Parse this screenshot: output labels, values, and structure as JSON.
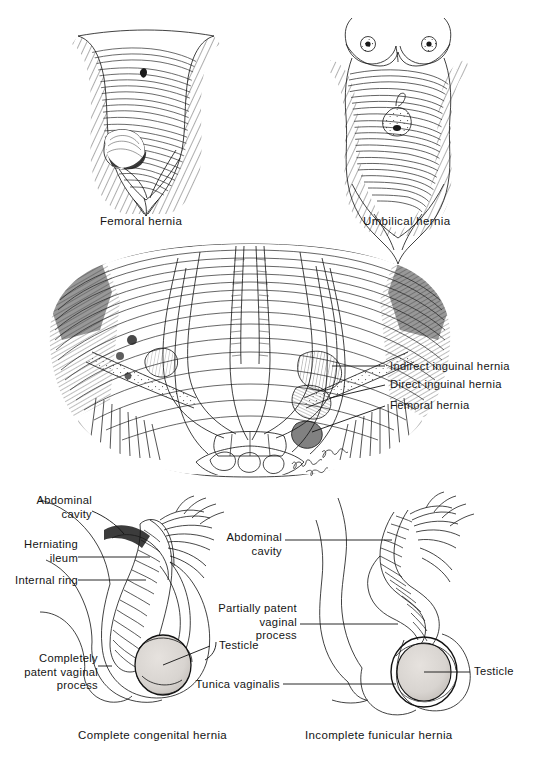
{
  "plate": {
    "title": "Hernia types anatomical plate",
    "background": "#ffffff",
    "ink_color": "#111111",
    "tissue_fill": "#d8d4d0",
    "signature": "Cooper after Spalteholz"
  },
  "figures": [
    {
      "id": "femoral-hernia-external",
      "caption": "Femoral hernia",
      "description": "External view of male lower abdomen and groin with a rounded bulge in the right femoral region",
      "labels": []
    },
    {
      "id": "umbilical-hernia-external",
      "caption": "Umbilical hernia",
      "description": "External view of female torso with protruding umbilicus",
      "labels": []
    },
    {
      "id": "inguinal-region-internal",
      "caption": "",
      "description": "Internal posterior view of the lower abdominal wall and inguinal region",
      "labels": [
        {
          "text": "Indirect inguinal hernia",
          "side": "right"
        },
        {
          "text": "Direct inguinal hernia",
          "side": "right"
        },
        {
          "text": "Femoral hernia",
          "side": "right"
        }
      ]
    },
    {
      "id": "complete-congenital-hernia",
      "caption": "Complete congenital hernia",
      "description": "Sagittal section of scrotum with herniated ileum reaching the testicle",
      "labels": [
        {
          "text": "Abdominal cavity",
          "lines": [
            "Abdominal",
            "cavity"
          ],
          "side": "left"
        },
        {
          "text": "Herniating ileum",
          "lines": [
            "Herniating",
            "ileum"
          ],
          "side": "left"
        },
        {
          "text": "Internal ring",
          "lines": [
            "Internal ring"
          ],
          "side": "left"
        },
        {
          "text": "Completely patent vaginal process",
          "lines": [
            "Completely",
            "patent vaginal",
            "process"
          ],
          "side": "left"
        },
        {
          "text": "Testicle",
          "lines": [
            "Testicle"
          ],
          "side": "right"
        }
      ]
    },
    {
      "id": "incomplete-funicular-hernia",
      "caption": "Incomplete funicular hernia",
      "description": "Sagittal section of scrotum with hernia stopping above the tunica vaginalis",
      "labels": [
        {
          "text": "Abdominal cavity",
          "lines": [
            "Abdominal",
            "cavity"
          ],
          "side": "left"
        },
        {
          "text": "Partially patent vaginal process",
          "lines": [
            "Partially  patent",
            "vaginal",
            "process"
          ],
          "side": "left"
        },
        {
          "text": "Tunica vaginalis",
          "lines": [
            "Tunica  vaginalis"
          ],
          "side": "left"
        },
        {
          "text": "Testicle",
          "lines": [
            "Testicle"
          ],
          "side": "right"
        }
      ]
    }
  ],
  "captions": {
    "femoral": "Femoral hernia",
    "umbilical": "Umbilical hernia",
    "complete_congenital": "Complete congenital hernia",
    "incomplete_funicular": "Incomplete funicular hernia"
  },
  "mid_labels": {
    "indirect": "Indirect inguinal hernia",
    "direct": "Direct inguinal hernia",
    "femoral": "Femoral hernia"
  },
  "left_fig_labels": {
    "abdominal_1": "Abdominal",
    "abdominal_2": "cavity",
    "herniating_1": "Herniating",
    "herniating_2": "ileum",
    "internal_ring": "Internal ring",
    "patent_1": "Completely",
    "patent_2": "patent vaginal",
    "patent_3": "process",
    "testicle": "Testicle"
  },
  "right_fig_labels": {
    "abdominal_1": "Abdominal",
    "abdominal_2": "cavity",
    "partial_1": "Partially  patent",
    "partial_2": "vaginal",
    "partial_3": "process",
    "tunica": "Tunica  vaginalis",
    "testicle": "Testicle"
  }
}
